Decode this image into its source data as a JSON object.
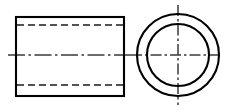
{
  "drawing": {
    "title": "Hollow Cylinder Orthographic Drawing",
    "canvas": {
      "width": 231,
      "height": 110,
      "background": "#ffffff"
    },
    "line_colors": {
      "visible": "#000000",
      "hidden": "#1a1a1a",
      "center": "#3a3a3a"
    },
    "views": [
      {
        "name": "front-view",
        "label": "Front View",
        "shape": "rectangle",
        "x": 16,
        "y": 17,
        "width": 108,
        "height": 79,
        "hidden_lines": [
          {
            "name": "bore-top-hidden-line",
            "x1": 16,
            "y1": 25,
            "x2": 124,
            "y2": 25
          },
          {
            "name": "bore-bottom-hidden-line",
            "x1": 16,
            "y1": 85,
            "x2": 124,
            "y2": 85
          }
        ],
        "center_line": {
          "name": "front-axis-center-line",
          "x1": 8,
          "y1": 55,
          "x2": 132,
          "y2": 55
        }
      },
      {
        "name": "side-view",
        "label": "Side View",
        "shape": "concentric-circles",
        "center_x": 178,
        "center_y": 55,
        "outer_radius": 41,
        "inner_radius": 31,
        "center_lines": [
          {
            "name": "side-horizontal-center-line",
            "x1": 131,
            "y1": 55,
            "x2": 222,
            "y2": 55
          },
          {
            "name": "side-vertical-center-line",
            "x1": 178,
            "y1": 5,
            "x2": 178,
            "y2": 105
          }
        ]
      }
    ]
  }
}
